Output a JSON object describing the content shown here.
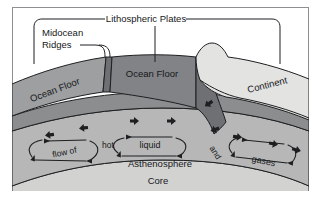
{
  "figure": {
    "title": "Lithospheric Plates",
    "frame_color": "#8d8f92",
    "background": "#ffffff"
  },
  "callouts": {
    "top_bracket_label": "Lithospheric Plates",
    "midocean_label_line1": "Midocean",
    "midocean_label_line2": "Ridges"
  },
  "layers": {
    "ocean_floor_left": {
      "label": "Ocean Floor",
      "color": "#9d9fa1"
    },
    "ocean_floor_center": {
      "label": "Ocean Floor",
      "color": "#818386"
    },
    "continent": {
      "label": "Continent",
      "color": "#e3e3e2"
    },
    "asthenosphere": {
      "label": "Asthenosphere",
      "color": "#b6b7b6"
    },
    "mantle_band": {
      "label": "",
      "color": "#8b8d8f"
    },
    "core": {
      "label": "Core",
      "color": "#d2d2d1"
    }
  },
  "convection": {
    "cells": [
      {
        "name": "left-cell",
        "label": "flow of"
      },
      {
        "name": "center-cell",
        "label": "liquid"
      },
      {
        "name": "right-cell",
        "label": "gases"
      }
    ],
    "inline_words": [
      {
        "name": "hot",
        "label": "hot"
      },
      {
        "name": "and",
        "label": "and"
      }
    ]
  },
  "plate_motion_markers": {
    "name": "plate-motion-arrow",
    "count": 9,
    "color": "#1d1f21"
  }
}
